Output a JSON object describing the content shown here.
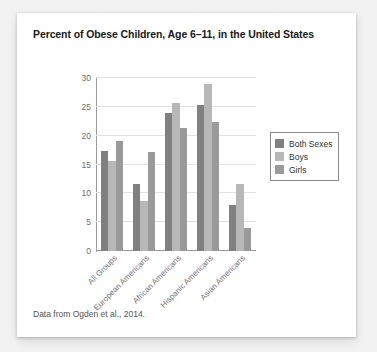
{
  "card": {
    "caption": "Data from Ogden et al., 2014."
  },
  "chart_data": {
    "type": "bar",
    "title": "Percent of Obese Children, Age 6–11, in the United States",
    "xlabel": "",
    "ylabel": "",
    "ylim": [
      0,
      30
    ],
    "yticks": [
      0,
      5,
      10,
      15,
      20,
      25,
      30
    ],
    "ytick_labels": [
      "0",
      "5",
      "10",
      "15",
      "20",
      "25",
      "30"
    ],
    "grid": true,
    "legend_position": "right-outside",
    "categories": [
      "All Groups",
      "European Americans",
      "African Americans",
      "Hispanic Americans",
      "Asian Americans"
    ],
    "series": [
      {
        "name": "Both Sexes",
        "color": "#808080",
        "values": [
          17.4,
          11.6,
          24.0,
          25.4,
          8.0
        ]
      },
      {
        "name": "Boys",
        "color": "#b8b8b8",
        "values": [
          15.6,
          8.6,
          25.7,
          28.9,
          11.6
        ]
      },
      {
        "name": "Girls",
        "color": "#9a9a9a",
        "values": [
          19.0,
          17.1,
          21.4,
          22.4,
          4.0
        ]
      }
    ]
  },
  "colors": {
    "both_sexes": "#808080",
    "boys": "#b8b8b8",
    "girls": "#9a9a9a",
    "axis": "#9a9a9a",
    "gridline": "#e2e2e2",
    "card_background": "#ffffff",
    "page_background": "#f2f2f2"
  }
}
